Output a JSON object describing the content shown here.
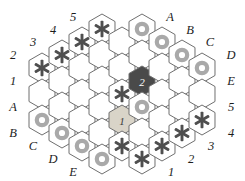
{
  "figure": {
    "colors": {
      "background": "#ffffff",
      "hex_fill": "#ffffff",
      "hex_stroke": "#6f6f6f",
      "star_piece": "#4f4f4f",
      "ring_piece": "#a9a9a9",
      "numbered_hex_1_fill": "#d9d4c8",
      "numbered_hex_2_fill": "#4a4a4a",
      "label_color": "#1c1c1c"
    },
    "geometry": {
      "hex_radius": 15,
      "center_x": 122,
      "center_y": 90,
      "columns": 9,
      "shape": "hexagonal-rhombus"
    }
  },
  "board": {
    "cells": [
      {
        "id": "c0r0",
        "cx": 42,
        "cy": 68,
        "piece": "star",
        "label": ""
      },
      {
        "id": "c0r1",
        "cx": 42,
        "cy": 94,
        "piece": "none",
        "label": ""
      },
      {
        "id": "c0r2",
        "cx": 42,
        "cy": 120,
        "piece": "ring",
        "label": ""
      },
      {
        "id": "c1r0",
        "cx": 62,
        "cy": 55,
        "piece": "star",
        "label": ""
      },
      {
        "id": "c1r1",
        "cx": 62,
        "cy": 81,
        "piece": "none",
        "label": ""
      },
      {
        "id": "c1r2",
        "cx": 62,
        "cy": 107,
        "piece": "none",
        "label": ""
      },
      {
        "id": "c1r3",
        "cx": 62,
        "cy": 133,
        "piece": "ring",
        "label": ""
      },
      {
        "id": "c2r0",
        "cx": 82,
        "cy": 42,
        "piece": "star",
        "label": ""
      },
      {
        "id": "c2r1",
        "cx": 82,
        "cy": 68,
        "piece": "none",
        "label": ""
      },
      {
        "id": "c2r2",
        "cx": 82,
        "cy": 94,
        "piece": "none",
        "label": ""
      },
      {
        "id": "c2r3",
        "cx": 82,
        "cy": 120,
        "piece": "none",
        "label": ""
      },
      {
        "id": "c2r4",
        "cx": 82,
        "cy": 146,
        "piece": "ring",
        "label": ""
      },
      {
        "id": "c3r0",
        "cx": 102,
        "cy": 29,
        "piece": "star",
        "label": ""
      },
      {
        "id": "c3r1",
        "cx": 102,
        "cy": 55,
        "piece": "none",
        "label": ""
      },
      {
        "id": "c3r2",
        "cx": 102,
        "cy": 81,
        "piece": "none",
        "label": ""
      },
      {
        "id": "c3r3",
        "cx": 102,
        "cy": 107,
        "piece": "none",
        "label": ""
      },
      {
        "id": "c3r4",
        "cx": 102,
        "cy": 133,
        "piece": "none",
        "label": ""
      },
      {
        "id": "c3r5",
        "cx": 102,
        "cy": 159,
        "piece": "ring",
        "label": ""
      },
      {
        "id": "c4r0",
        "cx": 122,
        "cy": 42,
        "piece": "none",
        "label": ""
      },
      {
        "id": "c4r1",
        "cx": 122,
        "cy": 68,
        "piece": "none",
        "label": ""
      },
      {
        "id": "c4r2",
        "cx": 122,
        "cy": 94,
        "piece": "star",
        "label": ""
      },
      {
        "id": "c4r3",
        "cx": 122,
        "cy": 120,
        "piece": "number",
        "label": "1"
      },
      {
        "id": "c4r4",
        "cx": 122,
        "cy": 146,
        "piece": "star",
        "label": ""
      },
      {
        "id": "c5r0",
        "cx": 142,
        "cy": 29,
        "piece": "ring",
        "label": ""
      },
      {
        "id": "c5r1",
        "cx": 142,
        "cy": 55,
        "piece": "none",
        "label": ""
      },
      {
        "id": "c5r2",
        "cx": 142,
        "cy": 81,
        "piece": "number",
        "label": "2"
      },
      {
        "id": "c5r3",
        "cx": 142,
        "cy": 107,
        "piece": "ring",
        "label": ""
      },
      {
        "id": "c5r4",
        "cx": 142,
        "cy": 133,
        "piece": "none",
        "label": ""
      },
      {
        "id": "c5r5",
        "cx": 142,
        "cy": 159,
        "piece": "star",
        "label": ""
      },
      {
        "id": "c6r0",
        "cx": 162,
        "cy": 42,
        "piece": "ring",
        "label": ""
      },
      {
        "id": "c6r1",
        "cx": 162,
        "cy": 68,
        "piece": "none",
        "label": ""
      },
      {
        "id": "c6r2",
        "cx": 162,
        "cy": 94,
        "piece": "none",
        "label": ""
      },
      {
        "id": "c6r3",
        "cx": 162,
        "cy": 120,
        "piece": "none",
        "label": ""
      },
      {
        "id": "c6r4",
        "cx": 162,
        "cy": 146,
        "piece": "star",
        "label": ""
      },
      {
        "id": "c7r0",
        "cx": 182,
        "cy": 55,
        "piece": "ring",
        "label": ""
      },
      {
        "id": "c7r1",
        "cx": 182,
        "cy": 81,
        "piece": "none",
        "label": ""
      },
      {
        "id": "c7r2",
        "cx": 182,
        "cy": 107,
        "piece": "none",
        "label": ""
      },
      {
        "id": "c7r3",
        "cx": 182,
        "cy": 133,
        "piece": "star",
        "label": ""
      },
      {
        "id": "c8r0",
        "cx": 202,
        "cy": 68,
        "piece": "ring",
        "label": ""
      },
      {
        "id": "c8r1",
        "cx": 202,
        "cy": 94,
        "piece": "none",
        "label": ""
      },
      {
        "id": "c8r2",
        "cx": 202,
        "cy": 120,
        "piece": "star",
        "label": ""
      }
    ],
    "numbered_pieces": [
      {
        "label": "1",
        "style": "light",
        "cx": 122,
        "cy": 120
      },
      {
        "label": "2",
        "style": "dark",
        "cx": 142,
        "cy": 81
      }
    ]
  },
  "edge_labels": {
    "top_left": [
      {
        "text": "2",
        "x": 13,
        "y": 55
      },
      {
        "text": "3",
        "x": 33,
        "y": 42
      },
      {
        "text": "4",
        "x": 53,
        "y": 30
      },
      {
        "text": "5",
        "x": 73,
        "y": 17
      }
    ],
    "top_right": [
      {
        "text": "A",
        "x": 170,
        "y": 17
      },
      {
        "text": "B",
        "x": 190,
        "y": 30
      },
      {
        "text": "C",
        "x": 210,
        "y": 42
      },
      {
        "text": "D",
        "x": 231,
        "y": 55
      }
    ],
    "left": [
      {
        "text": "1",
        "x": 13,
        "y": 81
      },
      {
        "text": "A",
        "x": 13,
        "y": 107
      },
      {
        "text": "B",
        "x": 13,
        "y": 133
      }
    ],
    "right": [
      {
        "text": "E",
        "x": 231,
        "y": 81
      },
      {
        "text": "5",
        "x": 231,
        "y": 107
      },
      {
        "text": "4",
        "x": 231,
        "y": 133
      }
    ],
    "bottom_left": [
      {
        "text": "C",
        "x": 33,
        "y": 146
      },
      {
        "text": "D",
        "x": 53,
        "y": 159
      },
      {
        "text": "E",
        "x": 73,
        "y": 172
      }
    ],
    "bottom_right": [
      {
        "text": "3",
        "x": 211,
        "y": 146
      },
      {
        "text": "2",
        "x": 191,
        "y": 159
      },
      {
        "text": "1",
        "x": 171,
        "y": 172
      }
    ]
  }
}
